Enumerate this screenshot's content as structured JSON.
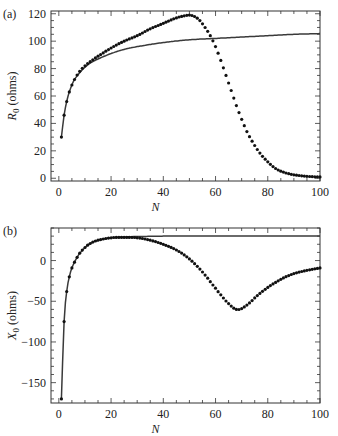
{
  "chart_data": [
    {
      "type": "line",
      "panel_label": "(a)",
      "title": "",
      "xlabel": "N",
      "ylabel_main": "R",
      "ylabel_sub": "0",
      "ylabel_unit": " (ohms)",
      "xlim": [
        -3,
        100
      ],
      "ylim": [
        -2,
        122
      ],
      "xticks": [
        0,
        20,
        40,
        60,
        80,
        100
      ],
      "yticks": [
        0,
        20,
        40,
        60,
        80,
        100,
        120
      ],
      "grid": false,
      "series": [
        {
          "name": "solid curve",
          "style": "line",
          "x": [
            1,
            2,
            3,
            4,
            5,
            6,
            8,
            10,
            12,
            15,
            20,
            25,
            30,
            40,
            50,
            60,
            70,
            80,
            90,
            100
          ],
          "values": [
            30,
            46,
            56,
            63,
            68,
            72,
            77,
            81,
            84,
            87,
            91,
            94,
            96,
            99,
            101,
            102,
            103,
            104,
            105,
            105.5
          ]
        },
        {
          "name": "dotted curve",
          "style": "dots",
          "x": [
            1,
            2,
            3,
            4,
            5,
            6,
            8,
            10,
            12,
            15,
            20,
            25,
            30,
            35,
            40,
            45,
            48,
            50,
            52,
            54,
            56,
            58,
            60,
            62,
            64,
            66,
            68,
            70,
            72,
            74,
            76,
            78,
            80,
            82,
            84,
            86,
            88,
            90,
            92,
            94,
            96,
            98,
            100
          ],
          "values": [
            30,
            46,
            56,
            63,
            68,
            72,
            78,
            82,
            85,
            89,
            95,
            100,
            104,
            109,
            113,
            117,
            118.5,
            119,
            118,
            115,
            110,
            104,
            96,
            86,
            75,
            64,
            53,
            43,
            34,
            27,
            21,
            16,
            12,
            8.5,
            6,
            4.5,
            3.3,
            2.5,
            2,
            1.6,
            1.3,
            1.1,
            1
          ]
        }
      ]
    },
    {
      "type": "line",
      "panel_label": "(b)",
      "title": "",
      "xlabel": "N",
      "ylabel_main": "X",
      "ylabel_sub": "0",
      "ylabel_unit": " (ohms)",
      "xlim": [
        -3,
        100
      ],
      "ylim": [
        -175,
        40
      ],
      "xticks": [
        0,
        20,
        40,
        60,
        80,
        100
      ],
      "yticks": [
        -150,
        -100,
        -50,
        0
      ],
      "grid": false,
      "series": [
        {
          "name": "solid curve",
          "style": "line",
          "x": [
            1,
            2,
            3,
            4,
            5,
            6,
            7,
            8,
            10,
            12,
            15,
            20,
            25,
            30,
            40,
            50,
            60,
            70,
            80,
            90,
            100
          ],
          "values": [
            -170,
            -75,
            -38,
            -20,
            -9,
            -2,
            4,
            9,
            16,
            21,
            25,
            28,
            29,
            29.5,
            30,
            30,
            30,
            30,
            30,
            30,
            30
          ]
        },
        {
          "name": "dotted curve",
          "style": "dots",
          "x": [
            1,
            2,
            3,
            4,
            5,
            6,
            7,
            8,
            10,
            12,
            15,
            20,
            25,
            30,
            35,
            40,
            45,
            50,
            55,
            60,
            63,
            66,
            68,
            70,
            73,
            76,
            80,
            85,
            90,
            95,
            100
          ],
          "values": [
            -170,
            -75,
            -38,
            -20,
            -9,
            -2,
            4,
            9,
            16,
            21,
            25,
            28,
            28.5,
            28,
            25,
            20,
            13,
            2,
            -14,
            -34,
            -46,
            -56,
            -60,
            -59,
            -52,
            -43,
            -33,
            -23,
            -16,
            -12,
            -9
          ]
        }
      ]
    }
  ]
}
